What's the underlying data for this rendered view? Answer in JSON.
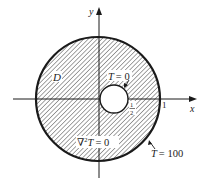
{
  "figure": {
    "axes": {
      "x_label": "x",
      "y_label": "y",
      "x_tick_outer": "1",
      "x_tick_inner_num": "1",
      "x_tick_inner_den": "2"
    },
    "region_label": "D",
    "inner_boundary_label": "T = 0",
    "inner_T": "T",
    "inner_eq": "= 0",
    "outer_boundary_label": "T = 100",
    "outer_T": "T",
    "outer_eq": "= 100",
    "pde_label": "∇²T = 0",
    "pde_nabla": "∇",
    "pde_sup": "2",
    "pde_T": "T",
    "pde_eq": "= 0",
    "colors": {
      "ink": "#1a1a1a",
      "hatch": "#333333",
      "background": "#ffffff"
    }
  }
}
